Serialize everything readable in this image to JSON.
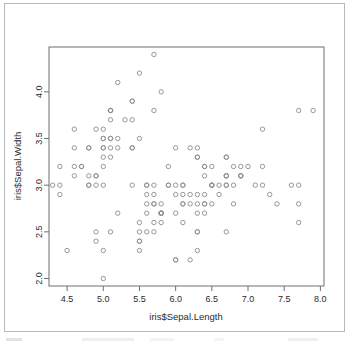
{
  "window": {
    "name": "r-graphics-device",
    "background": "#ffffff",
    "border_color": "#b9b9bc"
  },
  "chart_data": {
    "type": "scatter",
    "title": "",
    "subtitle": "",
    "xlabel": "iris$Sepal.Length",
    "ylabel": "iris$Sepal.Width",
    "xlim": [
      4.25,
      8.05
    ],
    "ylim": [
      1.92,
      4.48
    ],
    "xticks": [
      4.5,
      5.0,
      5.5,
      6.0,
      6.5,
      7.0,
      7.5,
      8.0
    ],
    "xticklabels": [
      "4.5",
      "5.0",
      "5.5",
      "6.0",
      "6.5",
      "7.0",
      "7.5",
      "8.0"
    ],
    "yticks": [
      2.0,
      2.5,
      3.0,
      3.5,
      4.0
    ],
    "yticklabels": [
      "2.0",
      "2.5",
      "3.0",
      "3.5",
      "4.0"
    ],
    "grid": false,
    "legend": null,
    "marker": {
      "shape": "open-circle",
      "radius": 2.2,
      "stroke": "#8c8c8c",
      "stroke_width": 0.9,
      "fill": "none"
    },
    "axis_color": "#6e6e73",
    "n_points": 150,
    "x": [
      5.1,
      4.9,
      4.7,
      4.6,
      5.0,
      5.4,
      4.6,
      5.0,
      4.4,
      4.9,
      5.4,
      4.8,
      4.8,
      4.3,
      5.8,
      5.7,
      5.4,
      5.1,
      5.7,
      5.1,
      5.4,
      5.1,
      4.6,
      5.1,
      4.8,
      5.0,
      5.0,
      5.2,
      5.2,
      4.7,
      4.8,
      5.4,
      5.2,
      5.5,
      4.9,
      5.0,
      5.5,
      4.9,
      4.4,
      5.1,
      5.0,
      4.5,
      4.4,
      5.0,
      5.1,
      4.8,
      5.1,
      4.6,
      5.3,
      5.0,
      7.0,
      6.4,
      6.9,
      5.5,
      6.5,
      5.7,
      6.3,
      4.9,
      6.6,
      5.2,
      5.0,
      5.9,
      6.0,
      6.1,
      5.6,
      6.7,
      5.6,
      5.8,
      6.2,
      5.6,
      5.9,
      6.1,
      6.3,
      6.1,
      6.4,
      6.6,
      6.8,
      6.7,
      6.0,
      5.7,
      5.5,
      5.5,
      5.8,
      6.0,
      5.4,
      6.0,
      6.7,
      6.3,
      5.6,
      5.5,
      5.5,
      6.1,
      5.8,
      5.0,
      5.6,
      5.7,
      5.7,
      6.2,
      5.1,
      5.7,
      6.3,
      5.8,
      7.1,
      6.3,
      6.5,
      7.6,
      4.9,
      7.3,
      6.7,
      7.2,
      6.5,
      6.4,
      6.8,
      5.7,
      5.8,
      6.4,
      6.5,
      7.7,
      7.7,
      6.0,
      6.9,
      5.6,
      7.7,
      6.3,
      6.7,
      7.2,
      6.2,
      6.1,
      6.4,
      7.2,
      7.4,
      7.9,
      6.4,
      6.3,
      6.1,
      7.7,
      6.3,
      6.4,
      6.0,
      6.9,
      6.7,
      6.9,
      5.8,
      6.8,
      6.7,
      6.7,
      6.3,
      6.5,
      6.2,
      5.9
    ],
    "y": [
      3.5,
      3.0,
      3.2,
      3.1,
      3.6,
      3.9,
      3.4,
      3.4,
      2.9,
      3.1,
      3.7,
      3.4,
      3.0,
      3.0,
      4.0,
      4.4,
      3.9,
      3.5,
      3.8,
      3.8,
      3.4,
      3.7,
      3.6,
      3.3,
      3.4,
      3.0,
      3.4,
      3.5,
      3.4,
      3.2,
      3.1,
      3.4,
      4.1,
      4.2,
      3.1,
      3.2,
      3.5,
      3.6,
      3.0,
      3.4,
      3.5,
      2.3,
      3.2,
      3.5,
      3.8,
      3.0,
      3.8,
      3.2,
      3.7,
      3.3,
      3.2,
      3.2,
      3.1,
      2.3,
      2.8,
      2.8,
      3.3,
      2.4,
      2.9,
      2.7,
      2.0,
      3.0,
      2.2,
      2.9,
      2.9,
      3.1,
      3.0,
      2.7,
      2.2,
      2.5,
      3.2,
      2.8,
      2.5,
      2.8,
      2.9,
      3.0,
      2.8,
      3.0,
      2.9,
      2.6,
      2.4,
      2.4,
      2.7,
      2.7,
      3.0,
      3.4,
      3.1,
      2.3,
      3.0,
      2.5,
      2.6,
      3.0,
      2.6,
      2.3,
      2.7,
      3.0,
      2.9,
      2.9,
      2.5,
      2.8,
      3.3,
      2.7,
      3.0,
      2.9,
      3.0,
      3.0,
      2.5,
      2.9,
      2.5,
      3.6,
      3.2,
      2.7,
      3.0,
      2.5,
      2.8,
      3.2,
      3.0,
      3.8,
      2.6,
      2.2,
      3.2,
      2.8,
      2.8,
      2.7,
      3.3,
      3.2,
      2.8,
      3.0,
      2.8,
      3.0,
      2.8,
      3.8,
      2.8,
      2.8,
      2.6,
      3.0,
      3.4,
      3.1,
      3.0,
      3.1,
      3.1,
      3.1,
      2.7,
      3.2,
      3.3,
      3.0,
      2.5,
      3.0,
      3.4,
      3.0
    ]
  }
}
